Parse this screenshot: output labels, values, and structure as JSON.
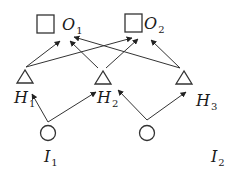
{
  "diagram": {
    "type": "neural-network",
    "layers": {
      "output": [
        {
          "id": "O1",
          "label": "O",
          "sub": "1",
          "shape": "square"
        },
        {
          "id": "O2",
          "label": "O",
          "sub": "2",
          "shape": "square"
        }
      ],
      "hidden": [
        {
          "id": "H1",
          "label": "H",
          "sub": "1",
          "shape": "triangle"
        },
        {
          "id": "H2",
          "label": "H",
          "sub": "2",
          "shape": "triangle"
        },
        {
          "id": "H3",
          "label": "H",
          "sub": "3",
          "shape": "triangle"
        }
      ],
      "input": [
        {
          "id": "I1",
          "label": "I",
          "sub": "1",
          "shape": "circle"
        },
        {
          "id": "I2",
          "label": "I",
          "sub": "2",
          "shape": "circle"
        }
      ]
    },
    "edges": [
      {
        "from": "H1",
        "to": "O1"
      },
      {
        "from": "H1",
        "to": "O2"
      },
      {
        "from": "H2",
        "to": "O1"
      },
      {
        "from": "H2",
        "to": "O2"
      },
      {
        "from": "H3",
        "to": "O1"
      },
      {
        "from": "H3",
        "to": "O2"
      },
      {
        "from": "I1",
        "to": "H1"
      },
      {
        "from": "I1",
        "to": "H2"
      },
      {
        "from": "I2",
        "to": "H2"
      },
      {
        "from": "I2",
        "to": "H3"
      }
    ],
    "colors": {
      "stroke": "#333333",
      "background": "#ffffff"
    }
  }
}
